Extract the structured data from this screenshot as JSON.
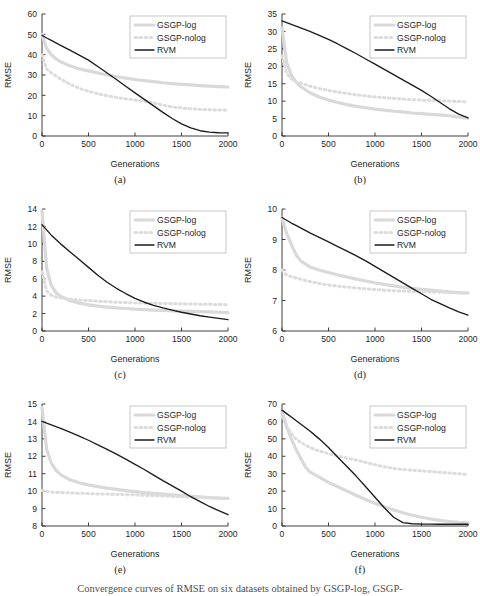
{
  "figure": {
    "caption": "Convergence curves of RMSE on six datasets obtained by GSGP-log, GSGP-",
    "series_names": [
      "GSGP-log",
      "GSGP-nolog",
      "RVM"
    ],
    "colors": {
      "gsgp_log": "#d9d9d9",
      "gsgp_nolog": "#dcdcdc",
      "rvm": "#1c1c1c",
      "axis": "#2b2b2b",
      "legend_border": "#b9b9b9",
      "background": "#ffffff"
    }
  },
  "chart_data": [
    {
      "type": "line",
      "panel": "(a)",
      "title": "",
      "xlabel": "Generations",
      "ylabel": "RMSE",
      "xlim": [
        0,
        2000
      ],
      "ylim": [
        0,
        60
      ],
      "xticks": [
        0,
        500,
        1000,
        1500,
        2000
      ],
      "yticks": [
        0,
        10,
        20,
        30,
        40,
        50,
        60
      ],
      "grid": false,
      "legend_position": "top-right",
      "x": [
        0,
        50,
        100,
        150,
        200,
        300,
        400,
        500,
        600,
        700,
        800,
        900,
        1000,
        1100,
        1200,
        1300,
        1400,
        1500,
        1600,
        1700,
        1800,
        1900,
        2000
      ],
      "series": [
        {
          "name": "GSGP-log",
          "values": [
            50,
            43,
            40,
            38,
            36.5,
            34.5,
            33,
            32,
            31,
            30,
            29.2,
            28.5,
            27.8,
            27.2,
            26.7,
            26.2,
            25.8,
            25.4,
            25.1,
            24.8,
            24.5,
            24.3,
            24.1
          ]
        },
        {
          "name": "GSGP-nolog",
          "values": [
            40,
            33,
            31,
            29.5,
            28,
            25.5,
            23.5,
            22,
            20.8,
            19.8,
            19,
            18.3,
            17.7,
            17.2,
            16.3,
            15.2,
            14.3,
            13.8,
            13.4,
            13.1,
            12.9,
            12.8,
            12.7
          ]
        },
        {
          "name": "RVM",
          "values": [
            49.5,
            48.2,
            47,
            45.8,
            44.6,
            42.2,
            39.8,
            37.3,
            34.2,
            31,
            27.8,
            24.5,
            21.2,
            18,
            14.8,
            11.6,
            8.6,
            6,
            4,
            2.6,
            1.9,
            1.6,
            1.5
          ]
        }
      ]
    },
    {
      "type": "line",
      "panel": "(b)",
      "title": "",
      "xlabel": "Generations",
      "ylabel": "RMSE",
      "xlim": [
        0,
        2000
      ],
      "ylim": [
        0,
        35
      ],
      "xticks": [
        0,
        500,
        1000,
        1500,
        2000
      ],
      "yticks": [
        0,
        5,
        10,
        15,
        20,
        25,
        30,
        35
      ],
      "grid": false,
      "legend_position": "top-right",
      "x": [
        0,
        50,
        100,
        150,
        200,
        300,
        400,
        500,
        600,
        700,
        800,
        900,
        1000,
        1100,
        1200,
        1300,
        1400,
        1500,
        1600,
        1700,
        1800,
        1900,
        2000
      ],
      "series": [
        {
          "name": "GSGP-log",
          "values": [
            31,
            21,
            17.5,
            15.5,
            14.2,
            12.4,
            11.2,
            10.3,
            9.6,
            9,
            8.5,
            8.1,
            7.7,
            7.4,
            7.1,
            6.9,
            6.6,
            6.4,
            6.2,
            6.05,
            5.8,
            5.4,
            5.1
          ]
        },
        {
          "name": "GSGP-nolog",
          "values": [
            23,
            18,
            16.4,
            15.6,
            15.2,
            14.3,
            13.6,
            13.1,
            12.6,
            12.2,
            11.8,
            11.5,
            11.2,
            11,
            10.8,
            10.6,
            10.4,
            10.3,
            10.2,
            10.1,
            10,
            9.9,
            9.8
          ]
        },
        {
          "name": "RVM",
          "values": [
            33,
            32.5,
            32,
            31.5,
            31,
            30,
            28.9,
            27.7,
            26.4,
            25,
            23.6,
            22.1,
            20.6,
            19.1,
            17.6,
            16.1,
            14.6,
            13.1,
            11.4,
            9.6,
            7.8,
            6.3,
            5.2
          ]
        }
      ]
    },
    {
      "type": "line",
      "panel": "(c)",
      "title": "",
      "xlabel": "Generations",
      "ylabel": "RMSE",
      "xlim": [
        0,
        2000
      ],
      "ylim": [
        0,
        14
      ],
      "xticks": [
        0,
        500,
        1000,
        1500,
        2000
      ],
      "yticks": [
        0,
        2,
        4,
        6,
        8,
        10,
        12,
        14
      ],
      "grid": false,
      "legend_position": "top-right",
      "x": [
        0,
        50,
        100,
        150,
        200,
        300,
        400,
        500,
        600,
        700,
        800,
        900,
        1000,
        1100,
        1200,
        1300,
        1400,
        1500,
        1600,
        1700,
        1800,
        1900,
        2000
      ],
      "series": [
        {
          "name": "GSGP-log",
          "values": [
            13.8,
            7.2,
            5.2,
            4.4,
            4,
            3.5,
            3.2,
            3,
            2.85,
            2.75,
            2.65,
            2.58,
            2.5,
            2.45,
            2.4,
            2.35,
            2.3,
            2.28,
            2.25,
            2.22,
            2.2,
            2.15,
            2.1
          ]
        },
        {
          "name": "GSGP-nolog",
          "values": [
            6.8,
            4.6,
            4.1,
            3.9,
            3.8,
            3.65,
            3.55,
            3.5,
            3.42,
            3.36,
            3.3,
            3.26,
            3.22,
            3.2,
            3.18,
            3.16,
            3.14,
            3.12,
            3.1,
            3.08,
            3.06,
            3.04,
            3.02
          ]
        },
        {
          "name": "RVM",
          "values": [
            12.2,
            11.6,
            11,
            10.5,
            10,
            9.1,
            8.2,
            7.3,
            6.4,
            5.6,
            4.9,
            4.3,
            3.75,
            3.3,
            2.95,
            2.65,
            2.4,
            2.15,
            1.95,
            1.75,
            1.6,
            1.45,
            1.3
          ]
        }
      ]
    },
    {
      "type": "line",
      "panel": "(d)",
      "title": "",
      "xlabel": "Generations",
      "ylabel": "RMSE",
      "xlim": [
        0,
        2000
      ],
      "ylim": [
        6,
        10
      ],
      "xticks": [
        0,
        500,
        1000,
        1500,
        2000
      ],
      "yticks": [
        6,
        7,
        8,
        9,
        10
      ],
      "grid": false,
      "legend_position": "top-right",
      "x": [
        0,
        50,
        100,
        150,
        200,
        300,
        400,
        500,
        600,
        700,
        800,
        900,
        1000,
        1100,
        1200,
        1300,
        1400,
        1500,
        1600,
        1700,
        1800,
        1900,
        2000
      ],
      "series": [
        {
          "name": "GSGP-log",
          "values": [
            9.7,
            9.2,
            8.85,
            8.5,
            8.3,
            8.1,
            8,
            7.92,
            7.84,
            7.77,
            7.7,
            7.64,
            7.58,
            7.53,
            7.48,
            7.44,
            7.4,
            7.37,
            7.34,
            7.31,
            7.28,
            7.26,
            7.25
          ]
        },
        {
          "name": "GSGP-nolog",
          "values": [
            8,
            7.84,
            7.78,
            7.74,
            7.7,
            7.62,
            7.56,
            7.51,
            7.47,
            7.44,
            7.41,
            7.38,
            7.36,
            7.34,
            7.32,
            7.31,
            7.3,
            7.29,
            7.28,
            7.27,
            7.26,
            7.25,
            7.24
          ]
        },
        {
          "name": "RVM",
          "values": [
            9.72,
            9.63,
            9.54,
            9.46,
            9.38,
            9.22,
            9.07,
            8.92,
            8.77,
            8.62,
            8.46,
            8.3,
            8.12,
            7.94,
            7.76,
            7.58,
            7.4,
            7.22,
            7.04,
            6.9,
            6.76,
            6.63,
            6.52
          ]
        }
      ]
    },
    {
      "type": "line",
      "panel": "(e)",
      "title": "",
      "xlabel": "Generations",
      "ylabel": "RMSE",
      "xlim": [
        0,
        2000
      ],
      "ylim": [
        8,
        15
      ],
      "xticks": [
        0,
        500,
        1000,
        1500,
        2000
      ],
      "yticks": [
        8,
        9,
        10,
        11,
        12,
        13,
        14,
        15
      ],
      "grid": false,
      "legend_position": "top-right",
      "x": [
        0,
        50,
        100,
        150,
        200,
        300,
        400,
        500,
        600,
        700,
        800,
        900,
        1000,
        1100,
        1200,
        1300,
        1400,
        1500,
        1600,
        1700,
        1800,
        1900,
        2000
      ],
      "series": [
        {
          "name": "GSGP-log",
          "values": [
            14.8,
            12.4,
            11.6,
            11.2,
            10.95,
            10.65,
            10.48,
            10.36,
            10.26,
            10.17,
            10.1,
            10.03,
            9.97,
            9.92,
            9.87,
            9.83,
            9.79,
            9.75,
            9.71,
            9.67,
            9.63,
            9.6,
            9.58
          ]
        },
        {
          "name": "GSGP-nolog",
          "values": [
            10.05,
            9.98,
            9.95,
            9.93,
            9.92,
            9.9,
            9.88,
            9.86,
            9.84,
            9.83,
            9.81,
            9.8,
            9.78,
            9.76,
            9.74,
            9.72,
            9.7,
            9.68,
            9.66,
            9.64,
            9.62,
            9.6,
            9.58
          ]
        },
        {
          "name": "RVM",
          "values": [
            14,
            13.9,
            13.8,
            13.7,
            13.6,
            13.38,
            13.16,
            12.92,
            12.66,
            12.4,
            12.12,
            11.84,
            11.54,
            11.24,
            10.92,
            10.6,
            10.3,
            10,
            9.68,
            9.4,
            9.12,
            8.88,
            8.65
          ]
        }
      ]
    },
    {
      "type": "line",
      "panel": "(f)",
      "title": "",
      "xlabel": "Generations",
      "ylabel": "RMSE",
      "xlim": [
        0,
        2000
      ],
      "ylim": [
        0,
        70
      ],
      "xticks": [
        0,
        500,
        1000,
        1500,
        2000
      ],
      "yticks": [
        0,
        10,
        20,
        30,
        40,
        50,
        60,
        70
      ],
      "grid": false,
      "legend_position": "top-right",
      "x": [
        0,
        50,
        100,
        150,
        200,
        250,
        300,
        400,
        500,
        600,
        700,
        800,
        900,
        1000,
        1100,
        1200,
        1300,
        1400,
        1500,
        1600,
        1700,
        1800,
        1900,
        2000
      ],
      "series": [
        {
          "name": "GSGP-log",
          "values": [
            66,
            57,
            50,
            44,
            39,
            34,
            31,
            28,
            25,
            22.5,
            20,
            17.5,
            15.2,
            13,
            11,
            9.2,
            7.6,
            6.2,
            5,
            4,
            3.2,
            2.6,
            2.1,
            1.8
          ]
        },
        {
          "name": "GSGP-nolog",
          "values": [
            63,
            57,
            53,
            50,
            48,
            46.5,
            45,
            43,
            41.5,
            40.2,
            39,
            37.8,
            36.5,
            35.2,
            34,
            33,
            32.4,
            32,
            31.6,
            31.2,
            30.8,
            30.4,
            30,
            29.5
          ]
        },
        {
          "name": "RVM",
          "values": [
            66.5,
            64.5,
            62.5,
            60.5,
            58.5,
            56.5,
            54.5,
            50,
            45,
            39.5,
            34,
            28.5,
            22.5,
            16.5,
            10.5,
            5,
            1.9,
            1.3,
            1.1,
            1.05,
            1,
            1,
            1,
            1
          ]
        }
      ]
    }
  ]
}
